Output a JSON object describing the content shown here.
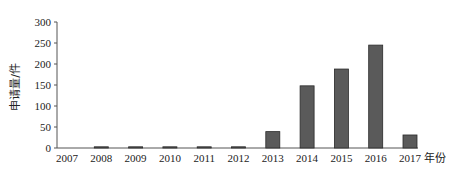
{
  "chart_data": {
    "type": "bar",
    "title": "",
    "xlabel": "年份",
    "ylabel": "申请量/件",
    "categories": [
      "2007",
      "2008",
      "2009",
      "2010",
      "2011",
      "2012",
      "2013",
      "2014",
      "2015",
      "2016",
      "2017"
    ],
    "values": [
      0,
      2,
      2,
      2,
      2,
      2,
      39,
      148,
      188,
      245,
      31
    ],
    "ylim": [
      0,
      300
    ],
    "yticks": [
      0,
      50,
      100,
      150,
      200,
      250,
      300
    ],
    "grid": false,
    "legend": null,
    "bar_color": "#5a5a5a",
    "bar_edge_color": "#2a2a2a"
  }
}
